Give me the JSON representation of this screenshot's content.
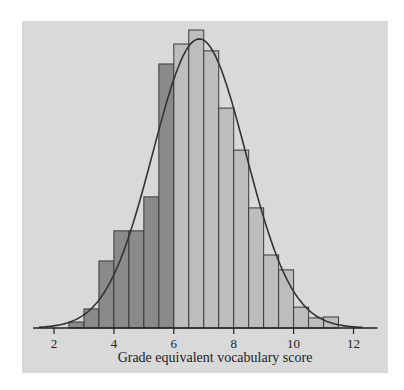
{
  "chart_data": {
    "type": "bar",
    "title": "",
    "xlabel": "Grade equivalent vocabulary score",
    "ylabel": "",
    "xlim": [
      1.3,
      12.8
    ],
    "ylim": [
      0,
      100
    ],
    "xticks": [
      2,
      4,
      6,
      8,
      10,
      12
    ],
    "xtick_labels": [
      "2",
      "4",
      "6",
      "8",
      "10",
      "12"
    ],
    "bin_width": 0.5,
    "bins": [
      {
        "start": 2.5,
        "end": 3.0,
        "value": 2,
        "group": "below-6"
      },
      {
        "start": 3.0,
        "end": 3.5,
        "value": 6.4,
        "group": "below-6"
      },
      {
        "start": 3.5,
        "end": 4.0,
        "value": 22.5,
        "group": "below-6"
      },
      {
        "start": 4.0,
        "end": 4.5,
        "value": 32.6,
        "group": "below-6"
      },
      {
        "start": 4.5,
        "end": 5.0,
        "value": 32.6,
        "group": "below-6"
      },
      {
        "start": 5.0,
        "end": 5.5,
        "value": 44,
        "group": "below-6"
      },
      {
        "start": 5.5,
        "end": 6.0,
        "value": 88.6,
        "group": "below-6"
      },
      {
        "start": 6.0,
        "end": 6.5,
        "value": 95.3,
        "group": "6-and-above"
      },
      {
        "start": 6.5,
        "end": 7.0,
        "value": 100,
        "group": "6-and-above"
      },
      {
        "start": 7.0,
        "end": 7.5,
        "value": 93,
        "group": "6-and-above"
      },
      {
        "start": 7.5,
        "end": 8.0,
        "value": 73.8,
        "group": "6-and-above"
      },
      {
        "start": 8.0,
        "end": 8.5,
        "value": 59.7,
        "group": "6-and-above"
      },
      {
        "start": 8.5,
        "end": 9.0,
        "value": 40.3,
        "group": "6-and-above"
      },
      {
        "start": 9.0,
        "end": 9.5,
        "value": 24.5,
        "group": "6-and-above"
      },
      {
        "start": 9.5,
        "end": 10.0,
        "value": 19.5,
        "group": "6-and-above"
      },
      {
        "start": 10.0,
        "end": 10.5,
        "value": 7,
        "group": "6-and-above"
      },
      {
        "start": 10.5,
        "end": 11.0,
        "value": 3.4,
        "group": "6-and-above"
      },
      {
        "start": 11.0,
        "end": 11.5,
        "value": 3.7,
        "group": "6-and-above"
      }
    ],
    "normal_curve": {
      "mean": 6.85,
      "sd": 1.55,
      "peak": 97,
      "x_range": [
        1.5,
        12.3
      ]
    },
    "colors": {
      "panel": "#d9d9d9",
      "bar_below_6": "#8a8a8a",
      "bar_6_and_above": "#bdbdbd",
      "outline": "#3a3a3a",
      "curve": "#333333"
    },
    "grid": false,
    "legend": "none"
  }
}
